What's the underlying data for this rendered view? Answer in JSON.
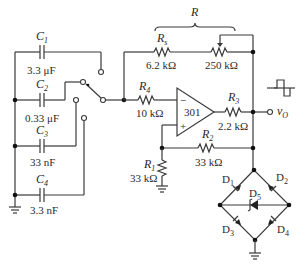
{
  "diagram": {
    "type": "circuit-schematic",
    "capacitors": [
      {
        "name": "C",
        "sub": "1",
        "value": "3.3 μF"
      },
      {
        "name": "C",
        "sub": "2",
        "value": "0.33 μF"
      },
      {
        "name": "C",
        "sub": "3",
        "value": "33 nF"
      },
      {
        "name": "C",
        "sub": "4",
        "value": "3.3 nF"
      }
    ],
    "resistors": {
      "R_group_label": "R",
      "Rs": {
        "name": "R",
        "sub": "s",
        "value": "6.2 kΩ"
      },
      "pot": {
        "value": "250 kΩ"
      },
      "R4": {
        "name": "R",
        "sub": "4",
        "value": "10 kΩ"
      },
      "R3": {
        "name": "R",
        "sub": "3",
        "value": "2.2 kΩ"
      },
      "R2": {
        "name": "R",
        "sub": "2",
        "value": "33 kΩ"
      },
      "R1": {
        "name": "R",
        "sub": "1",
        "value": "33 kΩ"
      }
    },
    "opamp": {
      "label": "301",
      "minus": "−",
      "plus": "+"
    },
    "diodes": [
      {
        "name": "D",
        "sub": "1"
      },
      {
        "name": "D",
        "sub": "2"
      },
      {
        "name": "D",
        "sub": "3"
      },
      {
        "name": "D",
        "sub": "4"
      },
      {
        "name": "D",
        "sub": "5"
      }
    ],
    "output": {
      "name": "v",
      "sub": "O"
    },
    "waveform_icon": "square-wave"
  }
}
